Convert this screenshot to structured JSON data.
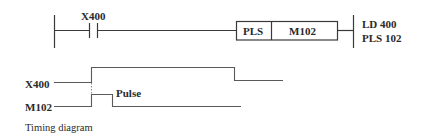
{
  "ladder": {
    "contact_label": "X400",
    "instruction": "PLS",
    "operand": "M102",
    "mnemonic_lines": [
      "LD 400",
      "PLS 102"
    ]
  },
  "timing": {
    "signals": [
      {
        "name": "X400"
      },
      {
        "name": "M102"
      }
    ],
    "pulse_label": "Pulse",
    "caption": "Timing diagram"
  },
  "colors": {
    "line": "#3a3a3a",
    "text": "#2a2a2a",
    "background": "#ffffff"
  }
}
